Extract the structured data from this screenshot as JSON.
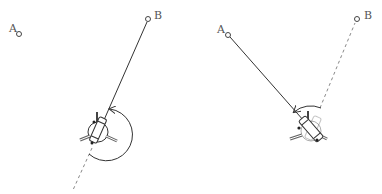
{
  "diagram": {
    "colors": {
      "stroke": "#333333",
      "dashed": "#888888",
      "label": "#555555",
      "background": "#ffffff"
    },
    "panels": [
      {
        "id": "left",
        "point_a": {
          "label": "A",
          "x": 19,
          "y": 34
        },
        "point_b": {
          "label": "B",
          "x": 148,
          "y": 19
        },
        "robot": {
          "x": 98,
          "y": 130,
          "heading_target": "B"
        },
        "solid_line": "robot-to-B",
        "dashed_line": "backward-extension",
        "rotation_arc": "large clockwise arc (right side) ending at line to B"
      },
      {
        "id": "right",
        "point_a": {
          "label": "A",
          "x": 37,
          "y": 35
        },
        "point_b": {
          "label": "B",
          "x": 166,
          "y": 19
        },
        "robot": {
          "x": 121,
          "y": 128,
          "heading_target": "A"
        },
        "solid_line": "robot-to-A",
        "dashed_line": "robot-to-B",
        "rotation_arc": "small counter-clockwise arc (top) from B direction to A direction"
      }
    ]
  }
}
